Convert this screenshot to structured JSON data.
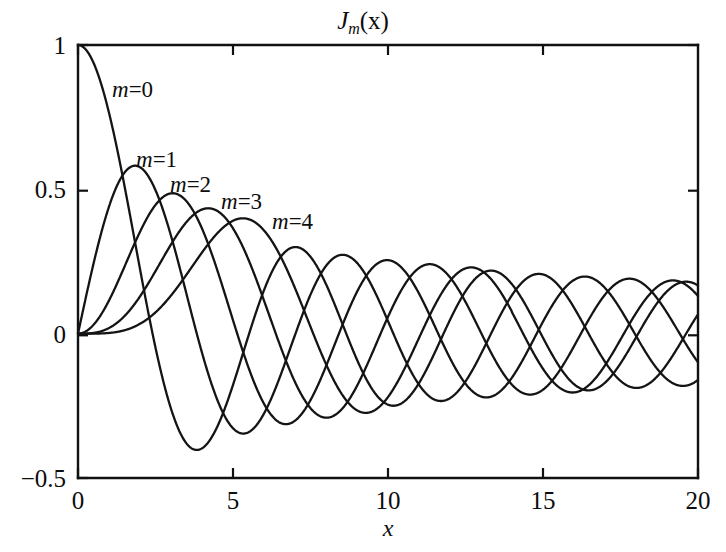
{
  "chart_data": {
    "type": "line",
    "title_parts": {
      "symbol": "J",
      "subscript": "m",
      "argument": "(x)"
    },
    "xlabel": "x",
    "ylabel": "",
    "xlim": [
      0,
      20
    ],
    "ylim": [
      -0.5,
      1
    ],
    "xticks": [
      0,
      5,
      10,
      15,
      20
    ],
    "xtick_labels": [
      "0",
      "5",
      "10",
      "15",
      "20"
    ],
    "yticks": [
      1,
      0.5,
      0,
      -0.5
    ],
    "ytick_labels": [
      "1",
      "0.5",
      "0",
      "-0.5"
    ],
    "grid": false,
    "legend": "inline-curve-labels",
    "line_color": "#141414",
    "background_color": "#ffffff",
    "annotations": [
      {
        "text": "m=0",
        "m": 0,
        "x_px": 112,
        "y_px": 78
      },
      {
        "text": "m=1",
        "m": 1,
        "x_px": 136,
        "y_px": 148
      },
      {
        "text": "m=2",
        "m": 2,
        "x_px": 170,
        "y_px": 173
      },
      {
        "text": "m=3",
        "m": 3,
        "x_px": 221,
        "y_px": 190
      },
      {
        "text": "m=4",
        "m": 4,
        "x_px": 272,
        "y_px": 210
      }
    ],
    "series": [
      {
        "name": "m=0",
        "order": 0,
        "first_max": {
          "x": 0,
          "y": 1.0
        },
        "first_min": {
          "x": 3.83,
          "y": -0.403
        },
        "zeros": [
          2.405,
          5.52,
          8.654,
          11.792,
          14.931,
          18.071
        ],
        "x": [
          0,
          0.5,
          1,
          1.5,
          2,
          2.5,
          3,
          3.5,
          4,
          4.5,
          5,
          5.5,
          6,
          6.5,
          7,
          7.5,
          8,
          8.5,
          9,
          9.5,
          10,
          11,
          12,
          13,
          14,
          15,
          16,
          17,
          18,
          19,
          20
        ],
        "values": [
          1.0,
          0.938,
          0.765,
          0.512,
          0.224,
          -0.048,
          -0.26,
          -0.38,
          -0.397,
          -0.321,
          -0.178,
          -0.007,
          0.151,
          0.26,
          0.3,
          0.266,
          0.172,
          0.042,
          -0.09,
          -0.194,
          -0.246,
          -0.171,
          0.047,
          0.207,
          0.171,
          -0.014,
          -0.175,
          -0.169,
          -0.013,
          0.147,
          0.167
        ]
      },
      {
        "name": "m=1",
        "order": 1,
        "first_max": {
          "x": 1.84,
          "y": 0.582
        },
        "zeros": [
          3.832,
          7.016,
          10.174,
          13.324,
          16.471,
          19.616
        ],
        "x": [
          0,
          0.5,
          1,
          1.5,
          2,
          2.5,
          3,
          3.5,
          4,
          4.5,
          5,
          5.5,
          6,
          6.5,
          7,
          7.5,
          8,
          8.5,
          9,
          9.5,
          10,
          11,
          12,
          13,
          14,
          15,
          16,
          17,
          18,
          19,
          20
        ],
        "values": [
          0.0,
          0.242,
          0.44,
          0.558,
          0.577,
          0.497,
          0.339,
          0.137,
          -0.066,
          -0.231,
          -0.328,
          -0.342,
          -0.277,
          -0.154,
          -0.005,
          0.135,
          0.235,
          0.273,
          0.245,
          0.161,
          0.043,
          -0.177,
          -0.223,
          -0.07,
          0.133,
          0.205,
          0.09,
          -0.098,
          -0.188,
          -0.105,
          0.067
        ]
      },
      {
        "name": "m=2",
        "order": 2,
        "first_max": {
          "x": 3.05,
          "y": 0.486
        },
        "zeros": [
          5.136,
          8.417,
          11.62,
          14.796,
          17.96
        ],
        "x": [
          0,
          0.5,
          1,
          1.5,
          2,
          2.5,
          3,
          3.5,
          4,
          4.5,
          5,
          5.5,
          6,
          6.5,
          7,
          7.5,
          8,
          8.5,
          9,
          9.5,
          10,
          11,
          12,
          13,
          14,
          15,
          16,
          17,
          18,
          19,
          20
        ],
        "values": [
          0.0,
          0.031,
          0.115,
          0.232,
          0.353,
          0.446,
          0.486,
          0.459,
          0.364,
          0.217,
          0.046,
          -0.117,
          -0.243,
          -0.307,
          -0.301,
          -0.23,
          -0.113,
          0.022,
          0.145,
          0.228,
          0.255,
          0.139,
          -0.085,
          -0.218,
          -0.152,
          0.042,
          0.186,
          0.158,
          -0.008,
          -0.157,
          -0.16
        ]
      },
      {
        "name": "m=3",
        "order": 3,
        "first_max": {
          "x": 4.2,
          "y": 0.434
        },
        "zeros": [
          6.38,
          9.761,
          13.015,
          16.223,
          19.409
        ],
        "x": [
          0,
          0.5,
          1,
          1.5,
          2,
          2.5,
          3,
          3.5,
          4,
          4.5,
          5,
          5.5,
          6,
          6.5,
          7,
          7.5,
          8,
          8.5,
          9,
          9.5,
          10,
          11,
          12,
          13,
          14,
          15,
          16,
          17,
          18,
          19,
          20
        ],
        "values": [
          0.0,
          0.003,
          0.02,
          0.061,
          0.129,
          0.217,
          0.309,
          0.387,
          0.43,
          0.425,
          0.365,
          0.256,
          0.115,
          -0.035,
          -0.167,
          -0.258,
          -0.291,
          -0.262,
          -0.181,
          -0.068,
          0.058,
          0.227,
          0.195,
          0.003,
          -0.177,
          -0.194,
          -0.044,
          0.135,
          0.186,
          0.072,
          -0.099
        ]
      },
      {
        "name": "m=4",
        "order": 4,
        "first_max": {
          "x": 5.32,
          "y": 0.399
        },
        "zeros": [
          7.588,
          11.065,
          14.373,
          17.616
        ],
        "x": [
          0,
          0.5,
          1,
          1.5,
          2,
          2.5,
          3,
          3.5,
          4,
          4.5,
          5,
          5.5,
          6,
          6.5,
          7,
          7.5,
          8,
          8.5,
          9,
          9.5,
          10,
          11,
          12,
          13,
          14,
          15,
          16,
          17,
          18,
          19,
          20
        ],
        "values": [
          0.0,
          0.0002,
          0.002,
          0.008,
          0.034,
          0.074,
          0.132,
          0.204,
          0.281,
          0.348,
          0.391,
          0.397,
          0.358,
          0.274,
          0.158,
          0.023,
          -0.105,
          -0.205,
          -0.265,
          -0.275,
          -0.22,
          0.015,
          0.182,
          0.219,
          0.076,
          -0.119,
          -0.202,
          -0.107,
          0.069,
          0.181,
          0.13
        ]
      }
    ]
  },
  "axes": {
    "title": "J",
    "title_sub": "m",
    "title_arg": "(x)",
    "xlabel": "x",
    "xtick_labels": [
      "0",
      "5",
      "10",
      "15",
      "20"
    ],
    "ytick_labels": [
      "1",
      "0.5",
      "0",
      "-0.5"
    ]
  },
  "curve_labels": [
    "m=0",
    "m=1",
    "m=2",
    "m=3",
    "m=4"
  ]
}
